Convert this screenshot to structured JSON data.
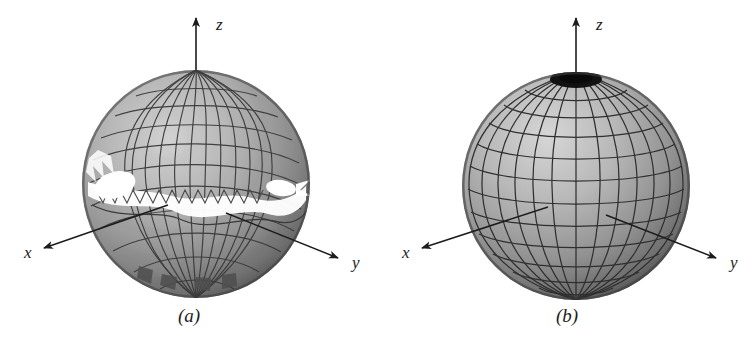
{
  "figure": {
    "background_color": "#ffffff",
    "width": 756,
    "height": 350,
    "style": "grayscale textbook line-art rendering of two parametric spheres"
  },
  "panels": [
    {
      "id": "a",
      "caption": "(a)",
      "description": "Sphere rendered from a distorted parameterization: the quadrilateral mesh is torn along a spiral seam, producing ragged sawtooth edges and open white gaps in the surface.",
      "sphere": {
        "center_x": 196,
        "center_y": 184,
        "radius": 114,
        "mesh_type": "distorted-spiral",
        "meridian_count": 24,
        "parallel_count": 18,
        "has_holes": true,
        "holes": [
          {
            "name": "left-crescent",
            "cx": 115,
            "cy": 185,
            "rx": 21,
            "ry": 13,
            "rotation": -18
          },
          {
            "name": "right-ellipse",
            "cx": 281,
            "cy": 188,
            "rx": 15,
            "ry": 8,
            "rotation": 8
          }
        ]
      },
      "axes": [
        {
          "name": "z",
          "label": "z",
          "label_x": 216,
          "label_y": 30,
          "from_x": 196,
          "from_y": 120,
          "to_x": 196,
          "to_y": 18
        },
        {
          "name": "x",
          "label": "x",
          "label_x": 24,
          "label_y": 258,
          "from_x": 168,
          "from_y": 205,
          "to_x": 44,
          "to_y": 248
        },
        {
          "name": "y",
          "label": "y",
          "label_x": 352,
          "label_y": 268,
          "from_x": 226,
          "from_y": 213,
          "to_x": 338,
          "to_y": 258
        }
      ]
    },
    {
      "id": "b",
      "caption": "(b)",
      "description": "Sphere rendered from a regular spherical parameterization: a clean latitude-longitude grid with meridians converging at a dark polar cap on top.",
      "sphere": {
        "center_x": 198,
        "center_y": 186,
        "radius": 114,
        "mesh_type": "regular-latlon",
        "meridian_count": 20,
        "parallel_count": 14,
        "has_holes": false,
        "pole_cap": {
          "name": "north-pole-cap",
          "cx": 198,
          "cy": 79,
          "rx": 26,
          "ry": 9,
          "color": "#121212"
        }
      },
      "axes": [
        {
          "name": "z",
          "label": "z",
          "label_x": 218,
          "label_y": 30,
          "from_x": 198,
          "from_y": 120,
          "to_x": 198,
          "to_y": 18
        },
        {
          "name": "x",
          "label": "x",
          "label_x": 24,
          "label_y": 258,
          "from_x": 170,
          "from_y": 207,
          "to_x": 44,
          "to_y": 248
        },
        {
          "name": "y",
          "label": "y",
          "label_x": 352,
          "label_y": 268,
          "from_x": 228,
          "from_y": 215,
          "to_x": 338,
          "to_y": 258
        }
      ]
    }
  ],
  "colors": {
    "background": "#ffffff",
    "surface_highlight": "#c6c6c6",
    "surface_mid": "#a8a8a8",
    "surface_shadow": "#5e5e5e",
    "surface_rim": "#3c3c3c",
    "mesh_line": "#3a3a3a",
    "axis_line": "#1c1c1c",
    "text": "#1c1c1c",
    "hole_fill": "#ffffff"
  }
}
